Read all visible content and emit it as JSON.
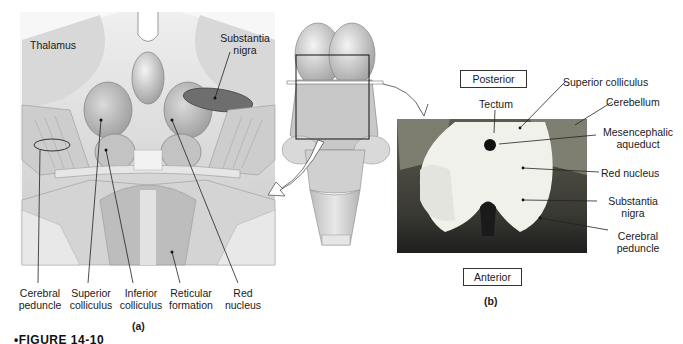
{
  "figure": {
    "caption_partial": "•FIGURE 14-10",
    "panels": {
      "a": {
        "letter": "(a)",
        "labels": {
          "thalamus": "Thalamus",
          "substantia_nigra_1": "Substantia",
          "substantia_nigra_2": "nigra",
          "cerebral_peduncle_1": "Cerebral",
          "cerebral_peduncle_2": "peduncle",
          "superior_colliculus_1": "Superior",
          "superior_colliculus_2": "colliculus",
          "inferior_colliculus_1": "Inferior",
          "inferior_colliculus_2": "colliculus",
          "reticular_formation_1": "Reticular",
          "reticular_formation_2": "formation",
          "red_nucleus_1": "Red",
          "red_nucleus_2": "nucleus"
        }
      },
      "b": {
        "letter": "(b)",
        "orientation": {
          "top": "Posterior",
          "bottom": "Anterior"
        },
        "labels": {
          "tectum": "Tectum",
          "superior_colliculus": "Superior colliculus",
          "cerebellum": "Cerebellum",
          "mesencephalic_aqueduct_1": "Mesencephalic",
          "mesencephalic_aqueduct_2": "aqueduct",
          "red_nucleus": "Red nucleus",
          "substantia_nigra_1": "Substantia",
          "substantia_nigra_2": "nigra",
          "cerebral_peduncle_1": "Cerebral",
          "cerebral_peduncle_2": "peduncle"
        }
      }
    }
  }
}
